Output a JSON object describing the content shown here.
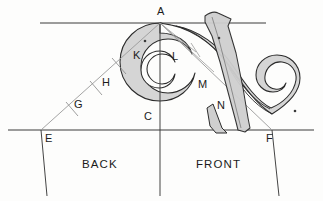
{
  "figure": {
    "type": "geometric-construction-drawing",
    "background_color": "#fdfdfc",
    "line_color": "#2b2b2b",
    "construction_line_color": "#8d8d8d",
    "fill_color": "#d2d2d2",
    "template_fill_color": "#c9c9c9"
  },
  "points": [
    {
      "id": "A",
      "label": "A",
      "x": 160,
      "y": 23,
      "label_x": 157,
      "label_y": 7
    },
    {
      "id": "C",
      "label": "C",
      "x": 160,
      "y": 130,
      "label_x": 144,
      "label_y": 112
    },
    {
      "id": "E",
      "label": "E",
      "x": 41,
      "y": 130,
      "label_x": 45,
      "label_y": 134
    },
    {
      "id": "F",
      "label": "F",
      "x": 272,
      "y": 130,
      "label_x": 266,
      "label_y": 134
    },
    {
      "id": "G",
      "label": "G",
      "x": 78,
      "y": 104,
      "label_x": 75,
      "label_y": 100
    },
    {
      "id": "H",
      "label": "H",
      "x": 108,
      "y": 80,
      "label_x": 103,
      "label_y": 78
    },
    {
      "id": "K",
      "label": "K",
      "x": 138,
      "y": 56,
      "label_x": 134,
      "label_y": 51
    },
    {
      "id": "L",
      "label": "L",
      "x": 176,
      "y": 58,
      "label_x": 173,
      "label_y": 52
    },
    {
      "id": "M",
      "label": "M",
      "x": 203,
      "y": 84,
      "label_x": 199,
      "label_y": 80
    },
    {
      "id": "N",
      "label": "N",
      "x": 222,
      "y": 105,
      "label_x": 218,
      "label_y": 101
    }
  ],
  "region_labels": [
    {
      "id": "back",
      "label": "BACK",
      "x": 82,
      "y": 160
    },
    {
      "id": "front",
      "label": "FRONT",
      "x": 196,
      "y": 160
    }
  ],
  "guides": {
    "top_rail": {
      "label": "top horizontal line",
      "x1": 40,
      "y1": 23,
      "x2": 266,
      "y2": 23
    },
    "baseline": {
      "label": "base horizontal line",
      "x1": 8,
      "y1": 130,
      "x2": 314,
      "y2": 130
    },
    "center_vertical": {
      "label": "vertical centre line AC",
      "x1": 160,
      "y1": 23,
      "x2": 160,
      "y2": 195
    },
    "diagonal_EA": {
      "label": "diagonal E to A",
      "x1": 41,
      "y1": 130,
      "x2": 160,
      "y2": 23
    },
    "diagonal_AF": {
      "label": "diagonal A to F",
      "x1": 160,
      "y1": 23,
      "x2": 272,
      "y2": 130
    },
    "left_edge": {
      "label": "left leg edge at E",
      "x1": 41,
      "y1": 130,
      "x2": 47,
      "y2": 196
    },
    "right_edge": {
      "label": "right leg edge at F",
      "x1": 272,
      "y1": 130,
      "x2": 279,
      "y2": 196
    }
  },
  "tick_marks": [
    {
      "id": "tick-G",
      "x": 72,
      "y": 109
    },
    {
      "id": "tick-H",
      "x": 96,
      "y": 88
    },
    {
      "id": "tick-K",
      "x": 120,
      "y": 66
    }
  ],
  "centre_dots": [
    {
      "id": "left-volute-centre",
      "x": 145,
      "y": 41
    },
    {
      "id": "template-centre",
      "x": 219,
      "y": 38
    },
    {
      "id": "right-volute-centre",
      "x": 295,
      "y": 111
    }
  ]
}
